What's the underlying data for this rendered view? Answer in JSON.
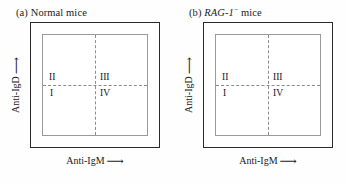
{
  "figure": {
    "background_color": "#fefefe",
    "frame_color": "#2b2b2b",
    "inner_frame_color": "#9a9a9a",
    "divider_color": "#8c8c8c"
  },
  "panels": [
    {
      "id": "a",
      "caption_prefix": "(a)",
      "caption_italic": "",
      "caption_superscript": "",
      "caption_suffix": "Normal mice",
      "caption_plain": "(a) Normal mice",
      "x_axis_label": "Anti-IgM",
      "x_axis_arrow": "⟶",
      "y_axis_label": "Anti-IgD",
      "y_axis_arrow": "⟶",
      "quadrants": {
        "top_left": "II",
        "top_right": "III",
        "bottom_left": "I",
        "bottom_right": "IV"
      }
    },
    {
      "id": "b",
      "caption_prefix": "(b)",
      "caption_italic": "RAG-1",
      "caption_superscript": "−",
      "caption_suffix": "mice",
      "caption_plain": "(b) RAG-1− mice",
      "x_axis_label": "Anti-IgM",
      "x_axis_arrow": "⟶",
      "y_axis_label": "Anti-IgD",
      "y_axis_arrow": "⟶",
      "quadrants": {
        "top_left": "II",
        "top_right": "III",
        "bottom_left": "I",
        "bottom_right": "IV"
      }
    }
  ]
}
